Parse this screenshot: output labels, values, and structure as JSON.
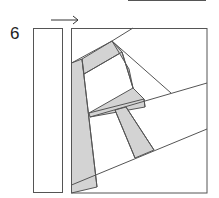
{
  "step_number": "6",
  "colors": {
    "line": "#555555",
    "fill": "#d3d3d3"
  }
}
